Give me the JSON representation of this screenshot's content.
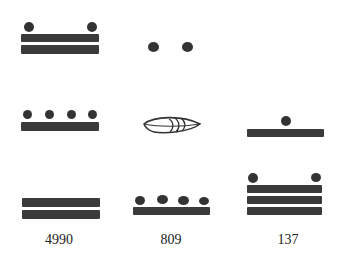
{
  "figure": {
    "columns": [
      {
        "label": "4990",
        "levels": [
          {
            "place": "400s",
            "value": 12,
            "bars": 2,
            "dots": 2
          },
          {
            "place": "20s",
            "value": 9,
            "bars": 1,
            "dots": 4
          },
          {
            "place": "1s",
            "value": 10,
            "bars": 2,
            "dots": 0
          }
        ]
      },
      {
        "label": "809",
        "levels": [
          {
            "place": "400s",
            "value": 2,
            "bars": 0,
            "dots": 2
          },
          {
            "place": "20s",
            "value": 0,
            "glyph": "shell-zero"
          },
          {
            "place": "1s",
            "value": 9,
            "bars": 1,
            "dots": 4
          }
        ]
      },
      {
        "label": "137",
        "levels": [
          {
            "place": "20s",
            "value": 6,
            "bars": 1,
            "dots": 1
          },
          {
            "place": "1s",
            "value": 17,
            "bars": 3,
            "dots": 2
          }
        ]
      }
    ],
    "colors": {
      "ink": "#3a3a3a",
      "background": "#ffffff"
    }
  }
}
